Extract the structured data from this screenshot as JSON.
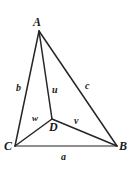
{
  "figure": {
    "background_color": "#ffffff",
    "stroke_color": "#262626",
    "base_stroke_color": "#6b6b6b",
    "vertices": [
      {
        "name": "A",
        "label": "A",
        "x": 39,
        "y": 31,
        "label_x": 33,
        "label_y": 16
      },
      {
        "name": "B",
        "label": "B",
        "x": 117,
        "y": 146,
        "label_x": 119,
        "label_y": 140
      },
      {
        "name": "C",
        "label": "C",
        "x": 15,
        "y": 146,
        "label_x": 4,
        "label_y": 140
      },
      {
        "name": "D",
        "label": "D",
        "x": 52,
        "y": 119,
        "label_x": 49,
        "label_y": 121
      }
    ],
    "edges": [
      {
        "name": "edge-AC",
        "from": "A",
        "to": "C",
        "label": "b",
        "label_x": 16,
        "label_y": 83
      },
      {
        "name": "edge-AB",
        "from": "A",
        "to": "B",
        "label": "c",
        "label_x": 85,
        "label_y": 81
      },
      {
        "name": "edge-CB",
        "from": "C",
        "to": "B",
        "label": "a",
        "label_x": 61,
        "label_y": 152
      },
      {
        "name": "edge-AD",
        "from": "A",
        "to": "D",
        "label": "u",
        "label_x": 52,
        "label_y": 85
      },
      {
        "name": "edge-DB",
        "from": "D",
        "to": "B",
        "label": "v",
        "label_x": 74,
        "label_y": 116
      },
      {
        "name": "edge-CD",
        "from": "C",
        "to": "D",
        "label": "w",
        "label_x": 32,
        "label_y": 114
      }
    ]
  }
}
